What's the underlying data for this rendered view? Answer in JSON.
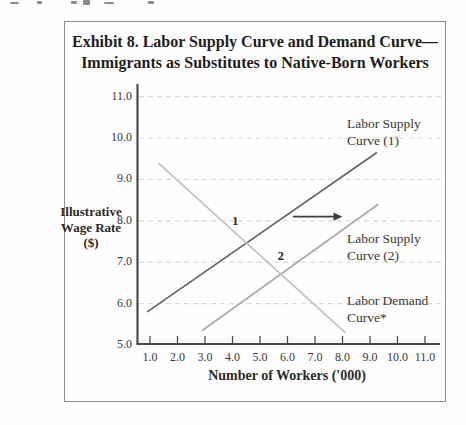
{
  "exhibit": {
    "title_line1": "Exhibit 8. Labor Supply Curve and Demand Curve—",
    "title_line2": "Immigrants as Substitutes to Native-Born Workers"
  },
  "colors": {
    "axis": "#4a4a4a",
    "gridline": "#dadada",
    "arrow": "#3f3f3f",
    "box_border": "#8f8f8f",
    "supply1": "#62626a",
    "supply2": "#a8a8a8",
    "demand": "#c0c0c0"
  },
  "chart_data": {
    "type": "line",
    "xlabel": "Number of Workers ('000)",
    "ylabel": "Illustrative Wage Rate ($)",
    "ylabel_lines": [
      "Illustrative",
      "Wage Rate",
      "($)"
    ],
    "xlim": [
      0.5,
      11.5
    ],
    "ylim": [
      5.0,
      11.0
    ],
    "xticks": [
      "1.0",
      "2.0",
      "3.0",
      "4.0",
      "5.0",
      "6.0",
      "7.0",
      "8.0",
      "9.0",
      "10.0",
      "11.0"
    ],
    "yticks_top_to_bottom": [
      "11.0",
      "10.0",
      "9.0",
      "8.0",
      "7.0",
      "6.0",
      "5.0"
    ],
    "grid": "horizontal-dashed",
    "grid_values": [
      6,
      7,
      8,
      9,
      10,
      11
    ],
    "legend_position": "labels-inline-right",
    "series": [
      {
        "name": "Labor Supply Curve (1)",
        "label_lines": [
          "Labor Supply",
          "Curve (1)"
        ],
        "color_key": "supply1",
        "points": [
          [
            0.9,
            5.8
          ],
          [
            9.25,
            9.65
          ]
        ]
      },
      {
        "name": "Labor Supply Curve (2)",
        "label_lines": [
          "Labor Supply",
          "Curve (2)"
        ],
        "color_key": "supply2",
        "points": [
          [
            2.9,
            5.35
          ],
          [
            9.3,
            8.4
          ]
        ]
      },
      {
        "name": "Labor Demand Curve*",
        "label_lines": [
          "Labor Demand",
          "Curve*"
        ],
        "color_key": "demand",
        "points": [
          [
            1.3,
            9.4
          ],
          [
            8.1,
            5.3
          ]
        ]
      }
    ],
    "annotations": {
      "point_labels": [
        {
          "text": "1",
          "x": 4.1,
          "y": 8.0
        },
        {
          "text": "2",
          "x": 5.75,
          "y": 7.15
        }
      ],
      "shift_arrow": {
        "from": [
          6.2,
          8.1
        ],
        "to": [
          8.0,
          8.1
        ]
      }
    }
  }
}
